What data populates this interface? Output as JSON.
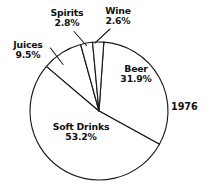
{
  "chart_data": {
    "type": "pie",
    "title": "",
    "subtitle": "",
    "xlabel": "",
    "ylabel": "",
    "annotation": "1976",
    "legend_position": "none",
    "grid": false,
    "units": "percent",
    "categories": [
      "Beer",
      "Soft Drinks",
      "Juices",
      "Spirits",
      "Wine"
    ],
    "values": [
      31.9,
      53.2,
      9.5,
      2.8,
      2.6
    ],
    "slices": [
      {
        "label": "Beer",
        "value": 31.9,
        "value_text": "31.9%",
        "label_placement": "inside",
        "leader_line": false,
        "fill": "#ffffff",
        "stroke": "#1a1a1a"
      },
      {
        "label": "Soft Drinks",
        "value": 53.2,
        "value_text": "53.2%",
        "label_placement": "inside",
        "leader_line": false,
        "fill": "#ffffff",
        "stroke": "#1a1a1a"
      },
      {
        "label": "Juices",
        "value": 9.5,
        "value_text": "9.5%",
        "label_placement": "outside",
        "leader_line": true,
        "fill": "#ffffff",
        "stroke": "#1a1a1a"
      },
      {
        "label": "Spirits",
        "value": 2.8,
        "value_text": "2.8%",
        "label_placement": "outside",
        "leader_line": true,
        "fill": "#ffffff",
        "stroke": "#1a1a1a"
      },
      {
        "label": "Wine",
        "value": 2.6,
        "value_text": "2.6%",
        "label_placement": "outside",
        "leader_line": true,
        "fill": "#ffffff",
        "stroke": "#1a1a1a"
      }
    ],
    "colors": {
      "slice_fill": "#ffffff",
      "outline": "#1a1a1a",
      "text": "#111111",
      "background": "#ffffff"
    }
  },
  "geometry": {
    "center_x": 99,
    "center_y": 111,
    "radius": 69,
    "start_angle_deg": -86
  }
}
